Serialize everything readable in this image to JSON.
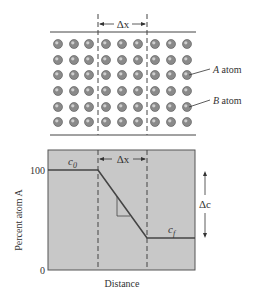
{
  "lattice": {
    "delta_x_label": "Δx",
    "a_atom_label": "atom",
    "a_atom_letter": "A",
    "b_atom_label": "atom",
    "b_atom_letter": "B",
    "rows": 6,
    "cols": 9,
    "atom_color": "#8a8a8a"
  },
  "graph": {
    "y_axis_label": "Percent atom A",
    "x_axis_label": "Distance",
    "y_tick_top": "100",
    "y_tick_bottom": "0",
    "c0_label": "c",
    "c0_sub": "0",
    "cf_label": "c",
    "cf_sub": "f",
    "delta_x_label": "Δx",
    "delta_c_label": "Δc",
    "fill_color": "#c8c8c8"
  },
  "chart_data": {
    "type": "line",
    "title": "",
    "xlabel": "Distance",
    "ylabel": "Percent atom A",
    "ylim": [
      0,
      100
    ],
    "x": [
      0,
      1,
      2,
      3
    ],
    "series": [
      {
        "name": "concentration profile",
        "values": [
          100,
          100,
          30,
          30
        ]
      }
    ],
    "annotations": [
      "c0",
      "cf",
      "Δx",
      "Δc"
    ]
  }
}
